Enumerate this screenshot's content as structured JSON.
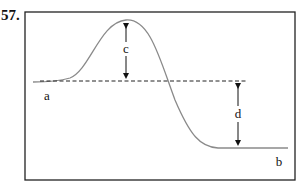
{
  "question_number": "57.",
  "labels": {
    "a": "a",
    "b": "b",
    "c": "c",
    "d": "d"
  },
  "colors": {
    "frame": "#222222",
    "curve": "#8a8a8a",
    "dashed": "#222222",
    "arrow": "#111111"
  },
  "diagram": {
    "type": "energy-profile"
  }
}
